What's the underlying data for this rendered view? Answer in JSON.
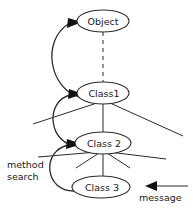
{
  "diagram": {
    "title": "method search",
    "nodes": [
      {
        "id": "object",
        "label": "Object",
        "cx": 103,
        "cy": 21,
        "rx": 26,
        "ry": 11
      },
      {
        "id": "class1",
        "label": "Class1",
        "cx": 103,
        "cy": 93,
        "rx": 26,
        "ry": 11
      },
      {
        "id": "class2",
        "label": "Class 2",
        "cx": 103,
        "cy": 143,
        "rx": 28,
        "ry": 11
      },
      {
        "id": "class3",
        "label": "Class 3",
        "cx": 101,
        "cy": 187,
        "rx": 29,
        "ry": 11
      }
    ],
    "annotations": [
      {
        "id": "method-search",
        "line1": "method",
        "line2": "search",
        "x": 7,
        "y": 160
      },
      {
        "id": "message",
        "label": "message",
        "x": 139,
        "y": 200
      }
    ],
    "edges": [
      {
        "id": "object-class1-dash",
        "style": "dashed"
      },
      {
        "id": "class1-fan-left",
        "style": "solid"
      },
      {
        "id": "class1-fan-center",
        "style": "solid"
      },
      {
        "id": "class1-fan-right",
        "style": "solid"
      },
      {
        "id": "class2-fan-far-left",
        "style": "solid"
      },
      {
        "id": "class2-fan-left",
        "style": "solid"
      },
      {
        "id": "class2-fan-center",
        "style": "solid"
      },
      {
        "id": "class2-fan-right",
        "style": "solid"
      },
      {
        "id": "class2-fan-far-right",
        "style": "solid"
      }
    ],
    "flows": [
      {
        "id": "search-class1-to-object",
        "from": "class1",
        "to": "object"
      },
      {
        "id": "search-class2-to-class1",
        "from": "class2",
        "to": "class1"
      },
      {
        "id": "search-class3-to-class2",
        "from": "class3",
        "to": "class2"
      },
      {
        "id": "message-to-class3",
        "from": "message",
        "to": "class3"
      }
    ],
    "colors": {
      "background": "#ffffff",
      "stroke": "#2b2b2b",
      "text": "#1a1a1a",
      "arrow": "#111111"
    }
  }
}
